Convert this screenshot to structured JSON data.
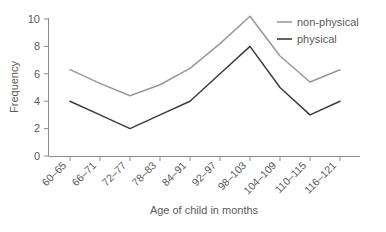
{
  "chart_data": {
    "type": "line",
    "title": "",
    "xlabel": "Age of child in months",
    "ylabel": "Frequency",
    "categories": [
      "60–65",
      "66–71",
      "72–77",
      "78–83",
      "84–91",
      "92–97",
      "98–103",
      "104–109",
      "110–115",
      "116–121"
    ],
    "yticks": [
      0,
      2,
      4,
      6,
      8,
      10
    ],
    "ylim": [
      0,
      10.8
    ],
    "grid": false,
    "legend_position": "top-right",
    "series": [
      {
        "name": "non-physical",
        "color": "#989898",
        "values": [
          6.3,
          5.3,
          4.4,
          5.2,
          6.4,
          8.2,
          10.2,
          7.3,
          5.4,
          6.3
        ]
      },
      {
        "name": "physical",
        "color": "#3c3c3c",
        "values": [
          4.0,
          3.0,
          2.0,
          3.0,
          4.0,
          6.0,
          8.0,
          5.0,
          3.0,
          4.0
        ]
      }
    ]
  },
  "axis": {
    "y_title": "Frequency",
    "x_title": "Age of child in months",
    "y_tick_labels": [
      "0",
      "2",
      "4",
      "6",
      "8",
      "10"
    ],
    "x_tick_labels": [
      "60–65",
      "66–71",
      "72–77",
      "78–83",
      "84–91",
      "92–97",
      "98–103",
      "104–109",
      "110–115",
      "116–121"
    ]
  },
  "legend": {
    "entries": [
      {
        "label": "non-physical",
        "color": "#989898"
      },
      {
        "label": "physical",
        "color": "#3c3c3c"
      }
    ]
  },
  "colors": {
    "axis": "#8c8c8c",
    "text": "#5a5a5a",
    "background": "#ffffff",
    "series_non_physical": "#989898",
    "series_physical": "#3c3c3c"
  }
}
